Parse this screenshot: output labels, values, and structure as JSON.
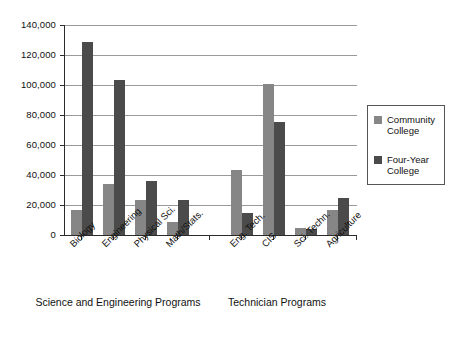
{
  "chart_data": {
    "type": "bar",
    "title": "",
    "xlabel": "",
    "ylabel": "",
    "ylim": [
      0,
      140000
    ],
    "grid": true,
    "legend_position": "right",
    "categories": [
      "Biology",
      "Engineering",
      "Physical Sci.",
      "Math/Stats.",
      "Eng. Tech.",
      "CIS",
      "Sci. Techn.",
      "Agriculture"
    ],
    "series": [
      {
        "name": "Community College",
        "color": "#868686",
        "values": [
          17000,
          34000,
          23500,
          8500,
          43500,
          100500,
          5000,
          17000
        ]
      },
      {
        "name": "Four-Year College",
        "color": "#4b4b4b",
        "values": [
          129000,
          103500,
          36000,
          23500,
          15000,
          75500,
          4000,
          24500
        ]
      }
    ],
    "y_ticks": [
      0,
      20000,
      40000,
      60000,
      80000,
      100000,
      120000,
      140000
    ],
    "y_tick_labels": [
      "0",
      "20,000",
      "40,000",
      "60,000",
      "80,000",
      "100,000",
      "120,000",
      "140,000"
    ],
    "groups": [
      {
        "label": "Science and\nEngineering Programs",
        "categories": [
          "Biology",
          "Engineering",
          "Physical Sci.",
          "Math/Stats."
        ]
      },
      {
        "label": "Technician\nPrograms",
        "categories": [
          "Eng. Tech.",
          "CIS",
          "Sci. Techn.",
          "Agriculture"
        ]
      }
    ]
  },
  "axis": {
    "y_tick_labels": [
      "140,000",
      "120,000",
      "100,000",
      "80,000",
      "60,000",
      "40,000",
      "20,000",
      "0"
    ]
  },
  "xlabels": [
    "Biology",
    "Engineering",
    "Physical Sci.",
    "Math/Stats.",
    "Eng. Tech.",
    "CIS",
    "Sci. Techn.",
    "Agriculture"
  ],
  "groups": {
    "left": "Science and\nEngineering Programs",
    "right": "Technician\nPrograms"
  },
  "legend": {
    "entries": [
      {
        "label": "Community\nCollege",
        "color": "#868686"
      },
      {
        "label": "Four-Year\nCollege",
        "color": "#4b4b4b"
      }
    ]
  }
}
